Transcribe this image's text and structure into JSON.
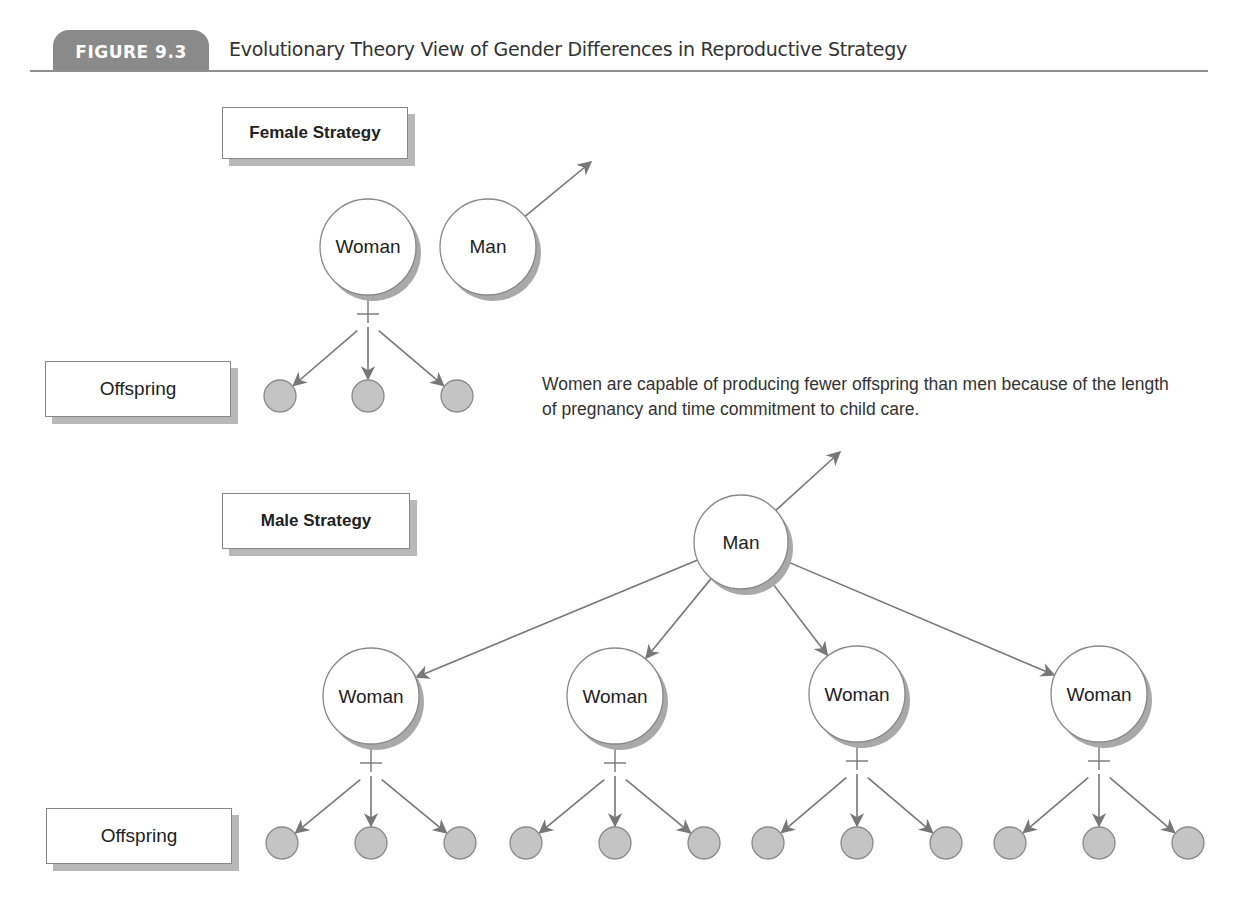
{
  "header": {
    "badge": "FIGURE 9.3",
    "title": "Evolutionary Theory View of Gender Differences in Reproductive Strategy"
  },
  "colors": {
    "badge_bg": "#8a8a8a",
    "rule": "#8f8f8f",
    "arrow": "#777777",
    "node_stroke": "#888888",
    "node_shadow": "#a9a9a9",
    "offspring_fill": "#c4c4c4"
  },
  "female_strategy": {
    "label": "Female Strategy",
    "offspring_label": "Offspring",
    "woman": {
      "label": "Woman",
      "cx": 368,
      "cy": 247,
      "r": 48
    },
    "man": {
      "label": "Man",
      "cx": 488,
      "cy": 247,
      "r": 48,
      "arrow_to": [
        591,
        162
      ]
    },
    "offspring": [
      {
        "cx": 280,
        "cy": 396
      },
      {
        "cx": 368,
        "cy": 396
      },
      {
        "cx": 457,
        "cy": 396
      }
    ],
    "caption": "Women are capable of producing fewer offspring than men because of the length of pregnancy and time commitment to child care."
  },
  "male_strategy": {
    "label": "Male Strategy",
    "offspring_label": "Offspring",
    "man": {
      "label": "Man",
      "cx": 741,
      "cy": 542,
      "r": 47,
      "arrow_to": [
        840,
        452
      ]
    },
    "women": [
      {
        "label": "Woman",
        "cx": 371,
        "cy": 696,
        "r": 48
      },
      {
        "label": "Woman",
        "cx": 615,
        "cy": 696,
        "r": 48
      },
      {
        "label": "Woman",
        "cx": 857,
        "cy": 694,
        "r": 48
      },
      {
        "label": "Woman",
        "cx": 1099,
        "cy": 694,
        "r": 48
      }
    ],
    "offspring_per_woman": 3
  }
}
